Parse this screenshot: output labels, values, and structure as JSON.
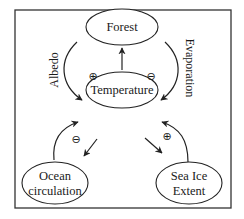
{
  "diagram": {
    "type": "feedback-loop",
    "nodes": {
      "forest": {
        "label": "Forest"
      },
      "temperature": {
        "label": "Temperature"
      },
      "ocean": {
        "label_line1": "Ocean",
        "label_line2": "circulation"
      },
      "seaice": {
        "label_line1": "Sea Ice",
        "label_line2": "Extent"
      }
    },
    "edges": {
      "albedo": {
        "from": "Forest",
        "to": "Temperature",
        "label": "Albedo",
        "sign": "⊕"
      },
      "evaporation": {
        "from": "Forest",
        "to": "Temperature",
        "label": "Evaporation",
        "sign": "⊖"
      },
      "temp_to_forest": {
        "from": "Temperature",
        "to": "Forest"
      },
      "ocean_loop": {
        "between": [
          "Temperature",
          "Ocean circulation"
        ],
        "sign": "⊖"
      },
      "seaice_loop": {
        "between": [
          "Temperature",
          "Sea Ice Extent"
        ],
        "sign": "⊕"
      }
    }
  }
}
